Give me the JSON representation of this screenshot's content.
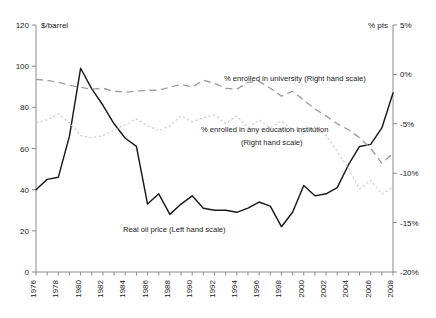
{
  "chart_data": {
    "type": "line",
    "title": "",
    "subtitle": "",
    "xlabel": "",
    "ylabel": "$/barrel",
    "y2label": "% pts",
    "grid": false,
    "legend_position": "inline-annotations",
    "x": [
      1976,
      1977,
      1978,
      1979,
      1980,
      1981,
      1982,
      1983,
      1984,
      1985,
      1986,
      1987,
      1988,
      1989,
      1990,
      1991,
      1992,
      1993,
      1994,
      1995,
      1996,
      1997,
      1998,
      1999,
      2000,
      2001,
      2002,
      2003,
      2004,
      2005,
      2006,
      2007,
      2008
    ],
    "xlim": [
      1976,
      2008
    ],
    "ylim": [
      0,
      120
    ],
    "y2lim": [
      -20,
      5
    ],
    "yticks": [
      0,
      20,
      40,
      60,
      80,
      100,
      120
    ],
    "yticklabels": [
      "0",
      "20",
      "40",
      "60",
      "80",
      "100",
      "120"
    ],
    "y2ticks": [
      -20,
      -15,
      -10,
      -5,
      0,
      5
    ],
    "y2ticklabels": [
      "-20%",
      "-15%",
      "-10%",
      "-5%",
      "0%",
      "5%"
    ],
    "xticks": [
      1976,
      1978,
      1980,
      1982,
      1984,
      1986,
      1988,
      1990,
      1992,
      1994,
      1996,
      1998,
      2000,
      2002,
      2004,
      2006,
      2008
    ],
    "xticklabels": [
      "1976",
      "1978",
      "1980",
      "1982",
      "1984",
      "1986",
      "1988",
      "1990",
      "1992",
      "1994",
      "1996",
      "1998",
      "2000",
      "2002",
      "2004",
      "2006",
      "2008"
    ],
    "minor_xticks_every": 1,
    "series": [
      {
        "name": "Real oil price (Left hand scale)",
        "axis": "left",
        "style": "solid",
        "color": "#1a1a1a",
        "values": [
          40,
          45,
          46,
          66,
          99,
          89,
          81,
          72,
          65,
          61,
          33,
          38,
          28,
          33,
          37,
          31,
          30,
          30,
          29,
          31,
          34,
          32,
          22,
          29,
          42,
          37,
          38,
          41,
          52,
          61,
          62,
          70,
          87
        ]
      },
      {
        "name": "% enrolled in university (Right hand scale)",
        "axis": "right",
        "style": "long-dash",
        "color": "#9d9d9d",
        "values": [
          -0.5,
          -0.6,
          -0.8,
          -1.1,
          -1.3,
          -1.5,
          -1.4,
          -1.7,
          -1.8,
          -1.7,
          -1.6,
          -1.6,
          -1.3,
          -1.0,
          -1.3,
          -0.6,
          -0.9,
          -1.4,
          -1.5,
          -0.8,
          -0.7,
          -1.4,
          -2.2,
          -1.7,
          -2.6,
          -3.5,
          -4.2,
          -5.0,
          -5.6,
          -6.4,
          -7.5,
          -9.0,
          -8.0
        ]
      },
      {
        "name": "% enrolled in any education institution (Right hand scale)",
        "axis": "right",
        "style": "dotted",
        "color": "#cfcfcf",
        "values": [
          -4.9,
          -4.6,
          -4.0,
          -4.9,
          -6.2,
          -6.4,
          -6.2,
          -5.6,
          -5.1,
          -4.5,
          -5.2,
          -5.7,
          -5.2,
          -4.2,
          -4.8,
          -4.4,
          -4.1,
          -5.0,
          -4.2,
          -5.4,
          -4.6,
          -5.4,
          -4.7,
          -5.6,
          -6.0,
          -5.3,
          -6.2,
          -7.8,
          -9.5,
          -11.6,
          -10.7,
          -12.1,
          -11.4
        ]
      }
    ],
    "annotations": [
      {
        "text": "% enrolled in university (Right hand scale)",
        "x_px": 224,
        "y_px": 81
      },
      {
        "text": "% enrolled in any education institution",
        "x_px": 201,
        "y_px": 132
      },
      {
        "text": "(Right hand scale)",
        "x_px": 241,
        "y_px": 145
      },
      {
        "text": "Real oil price (Left hand scale)",
        "x_px": 123,
        "y_px": 232
      }
    ]
  }
}
